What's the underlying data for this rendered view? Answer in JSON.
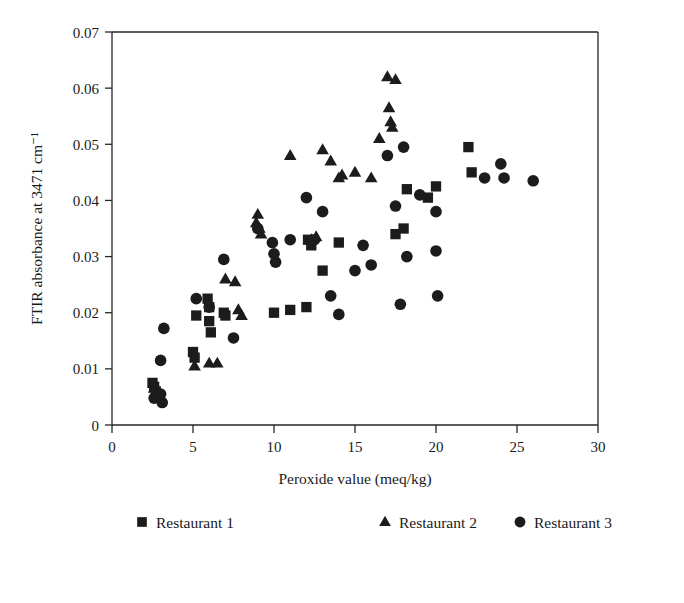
{
  "chart_data": {
    "type": "scatter",
    "title": "",
    "xlabel": "Peroxide value (meq/kg)",
    "ylabel": "FTIR absorbance at 3471 cm⁻¹",
    "xlim": [
      0,
      30
    ],
    "ylim": [
      0,
      0.07
    ],
    "xticks": [
      0,
      5,
      10,
      15,
      20,
      25,
      30
    ],
    "yticks": [
      0,
      0.01,
      0.02,
      0.03,
      0.04,
      0.05,
      0.06,
      0.07
    ],
    "xtick_labels": [
      "0",
      "5",
      "10",
      "15",
      "20",
      "25",
      "30"
    ],
    "ytick_labels": [
      "0",
      "0.01",
      "0.02",
      "0.03",
      "0.04",
      "0.05",
      "0.06",
      "0.07"
    ],
    "grid": false,
    "legend_position": "bottom",
    "marker_color": "#1c1c1c",
    "series": [
      {
        "name": "Restaurant 1",
        "marker": "square",
        "points": [
          [
            2.5,
            0.0075
          ],
          [
            2.6,
            0.0068
          ],
          [
            2.7,
            0.006
          ],
          [
            2.8,
            0.0052
          ],
          [
            5.0,
            0.013
          ],
          [
            5.1,
            0.012
          ],
          [
            5.2,
            0.0195
          ],
          [
            5.9,
            0.0225
          ],
          [
            6.0,
            0.021
          ],
          [
            6.0,
            0.0185
          ],
          [
            6.1,
            0.0165
          ],
          [
            6.9,
            0.02
          ],
          [
            7.0,
            0.0195
          ],
          [
            10.0,
            0.02
          ],
          [
            11.0,
            0.0205
          ],
          [
            12.0,
            0.021
          ],
          [
            12.1,
            0.033
          ],
          [
            12.3,
            0.032
          ],
          [
            13.0,
            0.0275
          ],
          [
            14.0,
            0.0325
          ],
          [
            17.5,
            0.034
          ],
          [
            18.0,
            0.035
          ],
          [
            18.2,
            0.042
          ],
          [
            19.5,
            0.0405
          ],
          [
            20.0,
            0.0425
          ],
          [
            22.0,
            0.0495
          ],
          [
            22.2,
            0.045
          ]
        ]
      },
      {
        "name": "Restaurant 2",
        "marker": "triangle",
        "points": [
          [
            2.6,
            0.0065
          ],
          [
            2.7,
            0.0055
          ],
          [
            5.1,
            0.0105
          ],
          [
            6.0,
            0.011
          ],
          [
            6.5,
            0.011
          ],
          [
            7.0,
            0.026
          ],
          [
            7.6,
            0.0255
          ],
          [
            7.8,
            0.0205
          ],
          [
            8.0,
            0.0195
          ],
          [
            8.9,
            0.036
          ],
          [
            9.0,
            0.0375
          ],
          [
            9.1,
            0.035
          ],
          [
            9.2,
            0.034
          ],
          [
            11.0,
            0.048
          ],
          [
            12.3,
            0.033
          ],
          [
            12.6,
            0.0335
          ],
          [
            13.0,
            0.049
          ],
          [
            13.5,
            0.047
          ],
          [
            14.0,
            0.044
          ],
          [
            14.2,
            0.0445
          ],
          [
            15.0,
            0.045
          ],
          [
            16.0,
            0.044
          ],
          [
            16.5,
            0.051
          ],
          [
            17.0,
            0.062
          ],
          [
            17.1,
            0.0565
          ],
          [
            17.2,
            0.054
          ],
          [
            17.3,
            0.053
          ],
          [
            17.5,
            0.0615
          ]
        ]
      },
      {
        "name": "Restaurant 3",
        "marker": "circle",
        "points": [
          [
            2.6,
            0.0048
          ],
          [
            2.8,
            0.005
          ],
          [
            3.0,
            0.0055
          ],
          [
            3.1,
            0.004
          ],
          [
            3.2,
            0.0172
          ],
          [
            3.0,
            0.0115
          ],
          [
            5.2,
            0.0225
          ],
          [
            6.0,
            0.021
          ],
          [
            6.9,
            0.0295
          ],
          [
            7.5,
            0.0155
          ],
          [
            9.0,
            0.035
          ],
          [
            9.9,
            0.0325
          ],
          [
            10.0,
            0.0305
          ],
          [
            10.1,
            0.029
          ],
          [
            11.0,
            0.033
          ],
          [
            12.0,
            0.0405
          ],
          [
            12.5,
            0.033
          ],
          [
            13.0,
            0.038
          ],
          [
            13.5,
            0.023
          ],
          [
            14.0,
            0.0197
          ],
          [
            15.0,
            0.0275
          ],
          [
            15.5,
            0.032
          ],
          [
            16.0,
            0.0285
          ],
          [
            17.0,
            0.048
          ],
          [
            17.5,
            0.039
          ],
          [
            17.8,
            0.0215
          ],
          [
            18.0,
            0.0495
          ],
          [
            18.2,
            0.03
          ],
          [
            19.0,
            0.041
          ],
          [
            20.0,
            0.038
          ],
          [
            20.0,
            0.031
          ],
          [
            20.1,
            0.023
          ],
          [
            23.0,
            0.044
          ],
          [
            24.0,
            0.0465
          ],
          [
            24.2,
            0.044
          ],
          [
            26.0,
            0.0435
          ]
        ]
      }
    ]
  },
  "legend": {
    "entries": [
      {
        "label": "Restaurant 1",
        "marker": "square"
      },
      {
        "label": "Restaurant 2",
        "marker": "triangle"
      },
      {
        "label": "Restaurant 3",
        "marker": "circle"
      }
    ]
  }
}
